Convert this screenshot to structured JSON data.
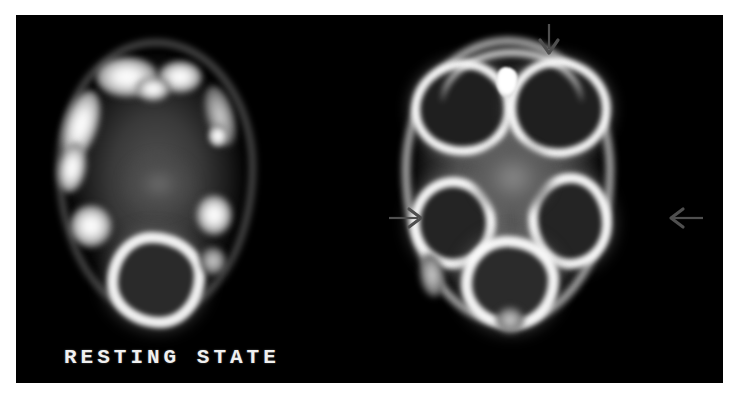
{
  "figure": {
    "type": "medical-imaging-comparison",
    "modality": "PET/SPECT axial brain scan",
    "background_color": "#ffffff",
    "panel_color": "#000000",
    "label_color": "#f0f0f0"
  },
  "panels": [
    {
      "id": "resting",
      "caption": "RESTING STATE",
      "position": "left",
      "description": "Axial brain slice, baseline perfusion, low cortical uptake"
    },
    {
      "id": "task",
      "caption": "LANGUAGE AND MUSIC",
      "position": "right",
      "description": "Axial brain slice during language and music task, increased cortical uptake"
    }
  ],
  "captions": {
    "left": "RESTING STATE",
    "right": "LANGUAGE AND MUSIC"
  },
  "annotations": [
    {
      "name": "arrow-top",
      "direction": "down",
      "target": "frontal midline activation",
      "color": "#555555"
    },
    {
      "name": "arrow-left",
      "direction": "right",
      "target": "left temporal activation",
      "color": "#555555"
    },
    {
      "name": "arrow-right",
      "direction": "left",
      "target": "right temporal activation",
      "color": "#555555"
    }
  ]
}
